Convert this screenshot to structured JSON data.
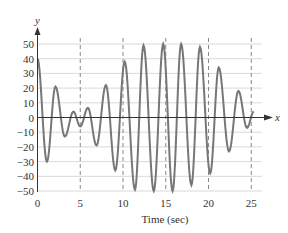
{
  "chart_data": {
    "type": "line",
    "title": "",
    "xlabel": "Time (sec)",
    "ylabel": "",
    "x_axis_var": "x",
    "y_axis_var": "y",
    "xlim": [
      0,
      26
    ],
    "ylim": [
      -50,
      55
    ],
    "x_ticks": [
      0,
      5,
      10,
      15,
      20,
      25
    ],
    "x_tick_labels": [
      "0",
      "5",
      "10",
      "15",
      "20",
      "25"
    ],
    "y_ticks": [
      50,
      40,
      30,
      20,
      10,
      0,
      -10,
      -20,
      -30,
      -40,
      -50
    ],
    "y_tick_labels": [
      "50",
      "40",
      "30",
      "20",
      "10",
      "0",
      "−10",
      "−20",
      "−30",
      "−40",
      "−50"
    ],
    "horizontal_grid": true,
    "vertical_dashed_lines_at": [
      5,
      10,
      15,
      20,
      25
    ],
    "legend": null,
    "series": [
      {
        "name": "signal",
        "color": "#777777",
        "points": [
          [
            0.0,
            40
          ],
          [
            1.1,
            -30
          ],
          [
            2.1,
            21
          ],
          [
            3.2,
            -13
          ],
          [
            4.2,
            4
          ],
          [
            5.0,
            -6
          ],
          [
            5.9,
            6.5
          ],
          [
            6.9,
            -19
          ],
          [
            8.0,
            22
          ],
          [
            9.1,
            -36
          ],
          [
            10.2,
            38
          ],
          [
            11.4,
            -49
          ],
          [
            12.4,
            49
          ],
          [
            13.6,
            -50
          ],
          [
            14.7,
            50
          ],
          [
            15.8,
            -50
          ],
          [
            16.8,
            50
          ],
          [
            18.0,
            -46
          ],
          [
            19.0,
            48
          ],
          [
            20.2,
            -38
          ],
          [
            21.2,
            34
          ],
          [
            22.4,
            -23
          ],
          [
            23.5,
            18
          ],
          [
            24.5,
            -7
          ],
          [
            25.3,
            4
          ]
        ]
      }
    ]
  },
  "colors": {
    "axis": "#333333",
    "grid": "#d9d9d9",
    "dashed": "#888888",
    "curve": "#7a7a7a"
  }
}
